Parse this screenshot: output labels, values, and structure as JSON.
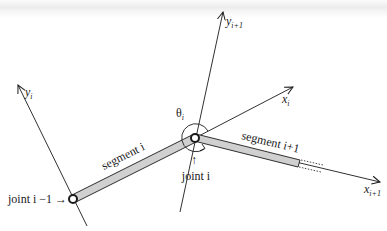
{
  "diagram": {
    "type": "kinematic-chain-joint-frames",
    "labels": {
      "y_i": "y",
      "y_i_sub": "i",
      "y_i1": "y",
      "y_i1_sub": "i+1",
      "x_i": "x",
      "x_i_sub": "i",
      "x_i1": "x",
      "x_i1_sub": "i+1",
      "theta": "θ",
      "theta_sub": "i",
      "segment_i": "segment i",
      "segment_i1": "segment i+1",
      "joint_i": "joint i",
      "joint_i_minus_1": "joint i −1 →",
      "joint_i_arrow": "↑"
    },
    "colors": {
      "line": "#1a1a1a",
      "segment_fill": "#d0d0d0",
      "joint_fill": "#ffffff"
    }
  }
}
